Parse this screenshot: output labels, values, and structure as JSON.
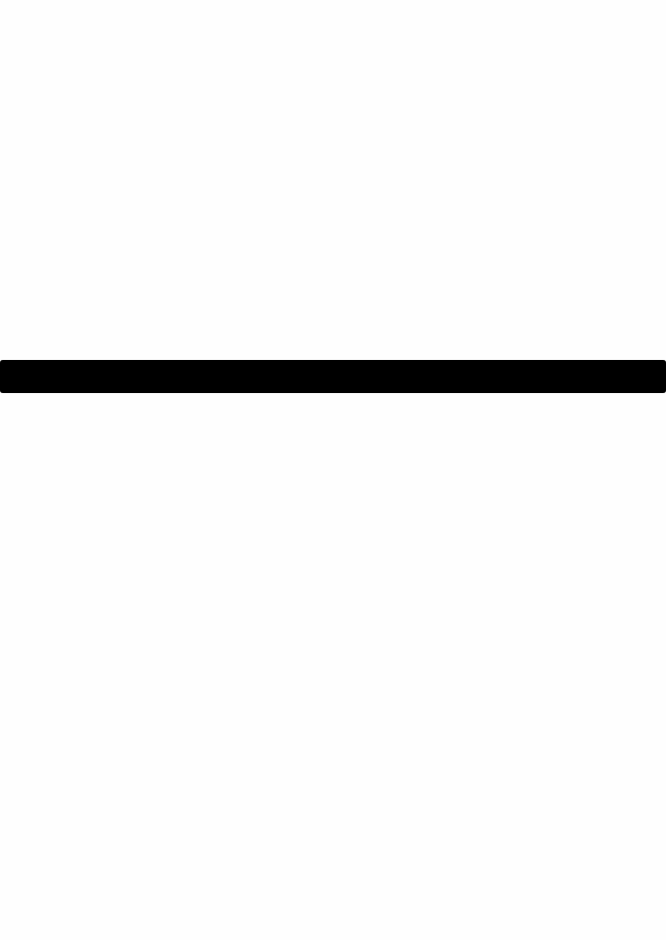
{
  "page": {
    "background_color": "#fefefe",
    "text_content": []
  },
  "bar": {
    "color": "#000000",
    "top_px": 360,
    "height_px": 33,
    "full_width": true
  }
}
